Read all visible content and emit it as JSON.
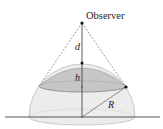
{
  "diagram": {
    "labels": {
      "observer": "Observer",
      "d": "d",
      "h": "h",
      "R": "R"
    },
    "colors": {
      "line": "#333333",
      "dashed": "#555555",
      "cap_fill": "#c9c9c9",
      "hemisphere_fill": "#ebebeb",
      "ground": "#444444"
    }
  }
}
